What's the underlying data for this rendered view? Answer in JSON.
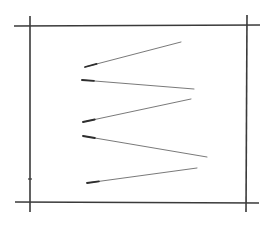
{
  "sketch": {
    "background": "#ffffff",
    "frame_color": "#3a3a3a",
    "stroke_color": "#6a6a6a",
    "stroke_head_color": "#2e2e2e",
    "frame_lines": [
      {
        "name": "top-line",
        "x1": 14,
        "y1": 26,
        "x2": 260,
        "y2": 25
      },
      {
        "name": "bottom-line",
        "x1": 15,
        "y1": 202,
        "x2": 259,
        "y2": 203
      },
      {
        "name": "left-line",
        "x1": 30,
        "y1": 16,
        "x2": 30,
        "y2": 212
      },
      {
        "name": "right-line",
        "x1": 247,
        "y1": 15,
        "x2": 246,
        "y2": 212
      }
    ],
    "strokes": [
      {
        "name": "stroke-1",
        "x1": 85,
        "y1": 67,
        "x2": 181,
        "y2": 42,
        "head_end": "start"
      },
      {
        "name": "stroke-2",
        "x1": 82,
        "y1": 80,
        "x2": 194,
        "y2": 89,
        "head_end": "start"
      },
      {
        "name": "stroke-3",
        "x1": 83,
        "y1": 122,
        "x2": 191,
        "y2": 99,
        "head_end": "start"
      },
      {
        "name": "stroke-4",
        "x1": 83,
        "y1": 136,
        "x2": 207,
        "y2": 157,
        "head_end": "start"
      },
      {
        "name": "stroke-5",
        "x1": 87,
        "y1": 183,
        "x2": 197,
        "y2": 168,
        "head_end": "start"
      }
    ],
    "tick_mark": {
      "x1": 28,
      "y1": 179,
      "x2": 32,
      "y2": 179
    }
  }
}
